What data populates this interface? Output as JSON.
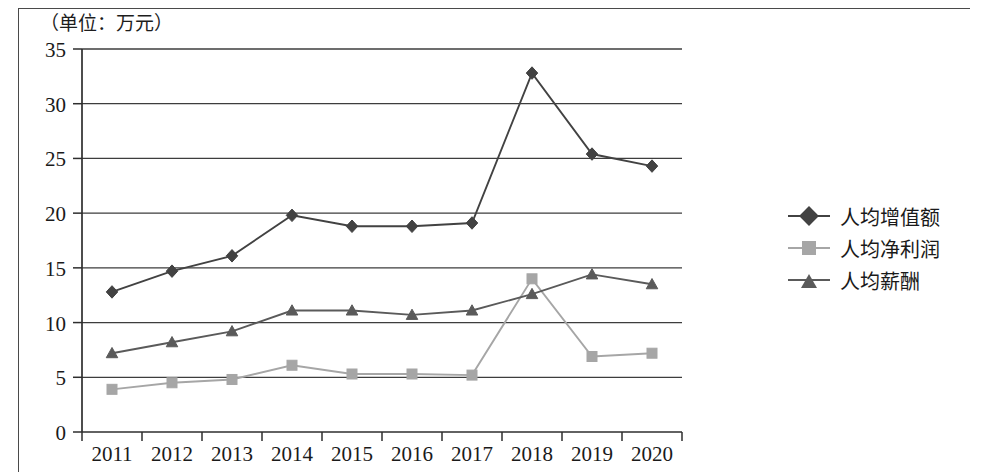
{
  "unit_label": "（单位：万元）",
  "chart_data": {
    "type": "line",
    "title": "",
    "subtitle": "",
    "xlabel": "",
    "ylabel": "",
    "unit_note": "（单位：万元）",
    "categories": [
      "2011",
      "2012",
      "2013",
      "2014",
      "2015",
      "2016",
      "2017",
      "2018",
      "2019",
      "2020"
    ],
    "x_tick_labels": [
      "2011",
      "2012",
      "2013",
      "2014",
      "2015",
      "2016",
      "2017",
      "2018",
      "2019",
      "2020"
    ],
    "y_tick_labels": [
      "0",
      "5",
      "10",
      "15",
      "20",
      "25",
      "30",
      "35"
    ],
    "y_ticks": [
      0,
      5,
      10,
      15,
      20,
      25,
      30,
      35
    ],
    "ylim": [
      0,
      35
    ],
    "grid": "horizontal",
    "legend_position": "right",
    "series": [
      {
        "name": "人均增值额",
        "marker": "diamond",
        "color": "#424242",
        "values": [
          12.8,
          14.7,
          16.1,
          19.8,
          18.8,
          18.8,
          19.1,
          32.8,
          25.4,
          24.3
        ]
      },
      {
        "name": "人均净利润",
        "marker": "square",
        "color": "#a6a6a6",
        "values": [
          3.9,
          4.5,
          4.8,
          6.1,
          5.3,
          5.3,
          5.2,
          14.0,
          6.9,
          7.2
        ]
      },
      {
        "name": "人均薪酬",
        "marker": "triangle",
        "color": "#5a5a5a",
        "values": [
          7.2,
          8.2,
          9.2,
          11.1,
          11.1,
          10.7,
          11.1,
          12.6,
          14.4,
          13.5
        ]
      }
    ]
  },
  "legend": {
    "items": [
      {
        "label": "人均增值额",
        "color": "#424242",
        "marker": "diamond"
      },
      {
        "label": "人均净利润",
        "color": "#a6a6a6",
        "marker": "square"
      },
      {
        "label": "人均薪酬",
        "color": "#5a5a5a",
        "marker": "triangle"
      }
    ]
  },
  "colors": {
    "axis": "#2e2e2e",
    "grid": "#3d3d3d",
    "text": "#1a1a1a",
    "border": "#4a4a4a",
    "background": "#ffffff"
  }
}
